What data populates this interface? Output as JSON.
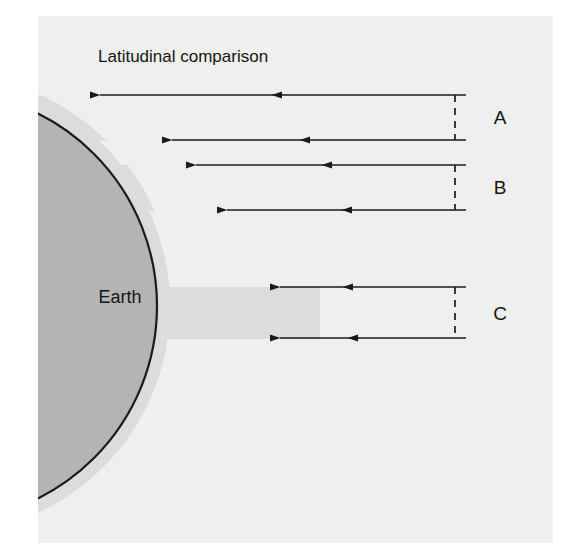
{
  "figure": {
    "title": "Latitudinal comparison",
    "earth_label": "Earth",
    "background_color": "#efefee",
    "page_color": "#ffffff",
    "earth_fill": "#b4b4b4",
    "earth_outline": "#1a1a1a",
    "atmosphere_fill": "#d8d8d6",
    "line_color": "#1a1a1a",
    "text_color": "#141414"
  },
  "bands": [
    {
      "label": "A"
    },
    {
      "label": "B"
    },
    {
      "label": "C"
    }
  ],
  "diagram_data": {
    "type": "diagram",
    "description": "Schematic cross-section of the Earth with incoming radiation paths at three latitudes",
    "earth": {
      "center_x": -58,
      "center_y": 306,
      "radius": 215,
      "clipped_left": true
    },
    "figure_frame": {
      "x": 38,
      "y": 16,
      "width": 515,
      "height": 527
    },
    "title_position": {
      "x": 98,
      "y": 62
    },
    "earth_label_position": {
      "x": 120,
      "y": 302
    },
    "arrow_right_end_x": 466,
    "ray_rows": [
      {
        "band": "A",
        "pair_index": 0,
        "y": 95,
        "start_x": 100,
        "mid_arrow_x": 272
      },
      {
        "band": "A",
        "pair_index": 1,
        "y": 140,
        "start_x": 172,
        "mid_arrow_x": 300
      },
      {
        "band": "B",
        "pair_index": 0,
        "y": 165,
        "start_x": 196,
        "mid_arrow_x": 322
      },
      {
        "band": "B",
        "pair_index": 1,
        "y": 210,
        "start_x": 227,
        "mid_arrow_x": 342
      },
      {
        "band": "C",
        "pair_index": 0,
        "y": 287,
        "start_x": 280,
        "mid_arrow_x": 343
      },
      {
        "band": "C",
        "pair_index": 1,
        "y": 338,
        "start_x": 280,
        "mid_arrow_x": 348
      }
    ],
    "brackets": [
      {
        "label": "A",
        "x": 455,
        "y_top": 95,
        "y_bottom": 140,
        "label_x": 500,
        "label_y": 124
      },
      {
        "label": "B",
        "x": 455,
        "y_top": 165,
        "y_bottom": 210,
        "label_x": 500,
        "label_y": 194
      },
      {
        "label": "C",
        "x": 455,
        "y_top": 287,
        "y_bottom": 338,
        "label_x": 500,
        "label_y": 319
      }
    ],
    "atmosphere_bands": [
      {
        "band": "A",
        "note": "light grey wedge between the A ray pair just outside the Earth limb"
      },
      {
        "band": "B",
        "note": "light grey wedge between the B ray pair just outside the Earth limb"
      },
      {
        "band": "C",
        "note": "light grey slab between the C ray pair just outside the Earth limb"
      }
    ]
  }
}
